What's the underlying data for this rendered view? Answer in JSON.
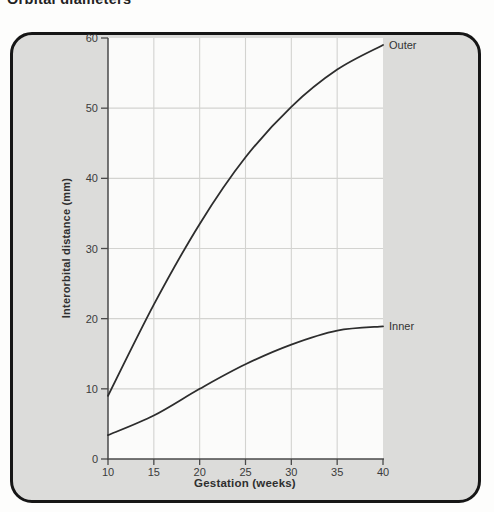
{
  "page": {
    "title": "Orbital diameters"
  },
  "chart_data": {
    "type": "line",
    "title": "Orbital diameters",
    "xlabel": "Gestation (weeks)",
    "ylabel": "Interorbital distance (mm)",
    "x": [
      10,
      15,
      20,
      25,
      30,
      35,
      40
    ],
    "series": [
      {
        "name": "Outer",
        "values": [
          9,
          22,
          33.5,
          43,
          50.2,
          55.5,
          59
        ]
      },
      {
        "name": "Inner",
        "values": [
          3.4,
          6.2,
          10,
          13.5,
          16.3,
          18.3,
          18.9
        ]
      }
    ],
    "xlim": [
      10,
      40
    ],
    "ylim": [
      0,
      60
    ],
    "x_ticks": [
      10,
      15,
      20,
      25,
      30,
      35,
      40
    ],
    "y_ticks": [
      0,
      10,
      20,
      30,
      40,
      50,
      60
    ],
    "grid": true,
    "legend_position": "labels at line ends (right side)"
  },
  "colors": {
    "figure_bg": "#dcdcda",
    "plot_bg": "#fbfbfa",
    "grid": "#d3d3d0",
    "axis": "#4a4a4a",
    "line": "#2d2d2d",
    "text": "#3b3b3b",
    "border": "#161616"
  }
}
